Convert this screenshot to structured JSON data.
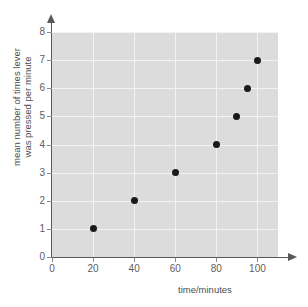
{
  "chart_data": {
    "type": "scatter",
    "title": "",
    "xlabel": "time/minutes",
    "ylabel_line1": "mean number of times lever",
    "ylabel_line2": "was pressed per minute",
    "x": [
      20,
      40,
      60,
      80,
      90,
      95,
      100
    ],
    "values": [
      1,
      2,
      3,
      4,
      5,
      6,
      7
    ],
    "points": [
      {
        "x": 20,
        "y": 1
      },
      {
        "x": 40,
        "y": 2
      },
      {
        "x": 60,
        "y": 3
      },
      {
        "x": 80,
        "y": 4
      },
      {
        "x": 90,
        "y": 5
      },
      {
        "x": 95,
        "y": 6
      },
      {
        "x": 100,
        "y": 7
      }
    ],
    "xlim": [
      0,
      110
    ],
    "ylim": [
      0,
      8
    ],
    "xticks": [
      "0",
      "20",
      "40",
      "60",
      "80",
      "100"
    ],
    "xtick_values": [
      0,
      20,
      40,
      60,
      80,
      100
    ],
    "yticks": [
      "0",
      "1",
      "2",
      "3",
      "4",
      "5",
      "6",
      "7",
      "8"
    ],
    "ytick_values": [
      0,
      1,
      2,
      3,
      4,
      5,
      6,
      7,
      8
    ],
    "grid": true,
    "legend": null,
    "legend_position": "none",
    "marker_color": "#1a1a1a",
    "plot_background": "#dcdcdc",
    "gridline_color": "#f2f2f2",
    "axis_color": "#585858",
    "figure_background": "#ffffff"
  }
}
